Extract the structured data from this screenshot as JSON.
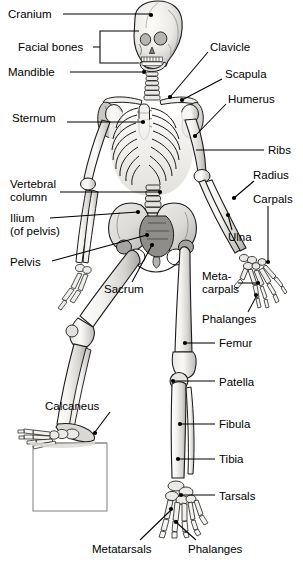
{
  "figure": {
    "view": "anterior standing figure with left foot raised on a box",
    "background_color": "#ffffff",
    "line_color": "#000000",
    "bone_fill_light": "#f2f1ee",
    "bone_fill_mid": "#d8d7d3",
    "bone_fill_dark": "#9e9c98",
    "bone_shadow": "#6f6d69",
    "box_fill": "#ffffff",
    "box_stroke": "#8a8a8a"
  },
  "labels": [
    {
      "id": "cranium",
      "text": "Cranium",
      "side": "left",
      "x": 8,
      "y": 8,
      "align": "left",
      "dot": {
        "x": 151,
        "y": 15
      },
      "path": "M 63 14 L 151 14"
    },
    {
      "id": "facial-bones",
      "text": "Facial bones",
      "side": "left",
      "x": 18,
      "y": 41,
      "align": "left",
      "dot": null,
      "path": "M 93 47 L 100 47 L 100 31 L 139 31 M 100 47 L 100 63 L 139 63"
    },
    {
      "id": "mandible",
      "text": "Mandible",
      "side": "left",
      "x": 8,
      "y": 66,
      "align": "left",
      "dot": {
        "x": 144,
        "y": 72
      },
      "path": "M 70 72 L 144 72"
    },
    {
      "id": "clavicle",
      "text": "Clavicle",
      "side": "right",
      "x": 210,
      "y": 41,
      "align": "left",
      "dot": {
        "x": 170,
        "y": 97
      },
      "path": "M 208 52 L 170 97"
    },
    {
      "id": "scapula",
      "text": "Scapula",
      "side": "right",
      "x": 225,
      "y": 68,
      "align": "left",
      "dot": {
        "x": 182,
        "y": 100
      },
      "path": "M 222 79 L 182 100"
    },
    {
      "id": "humerus",
      "text": "Humerus",
      "side": "right",
      "x": 228,
      "y": 93,
      "align": "left",
      "dot": {
        "x": 195,
        "y": 136
      },
      "path": "M 226 104 L 195 136"
    },
    {
      "id": "sternum",
      "text": "Sternum",
      "side": "left",
      "x": 12,
      "y": 112,
      "align": "left",
      "dot": {
        "x": 143,
        "y": 122
      },
      "path": "M 67 122 L 143 122"
    },
    {
      "id": "ribs",
      "text": "Ribs",
      "side": "right",
      "x": 268,
      "y": 144,
      "align": "left",
      "dot": null,
      "path": "M 264 150 L 196 150"
    },
    {
      "id": "radius",
      "text": "Radius",
      "side": "right",
      "x": 253,
      "y": 169,
      "align": "left",
      "dot": {
        "x": 234,
        "y": 198
      },
      "path": "M 254 181 L 234 198"
    },
    {
      "id": "carpals",
      "text": "Carpals",
      "side": "right",
      "x": 253,
      "y": 193,
      "align": "left",
      "dot": {
        "x": 268,
        "y": 262
      },
      "path": "M 268 206 L 268 262"
    },
    {
      "id": "vertebral-column",
      "text": "Vertebral\ncolumn",
      "side": "left",
      "x": 10,
      "y": 178,
      "align": "left",
      "dot": {
        "x": 160,
        "y": 192
      },
      "path": "M 60 192 L 160 192"
    },
    {
      "id": "ilium",
      "text": "Ilium\n(of pelvis)",
      "side": "left",
      "x": 10,
      "y": 212,
      "align": "left",
      "dot": {
        "x": 138,
        "y": 212
      },
      "path": "M 50 218 L 138 212"
    },
    {
      "id": "ulna",
      "text": "Ulna",
      "side": "right",
      "x": 228,
      "y": 231,
      "align": "left",
      "dot": {
        "x": 228,
        "y": 215
      },
      "path": "M 232 230 L 228 215"
    },
    {
      "id": "pelvis",
      "text": "Pelvis",
      "side": "left",
      "x": 10,
      "y": 256,
      "align": "left",
      "dot": {
        "x": 147,
        "y": 235
      },
      "path": "M 52 261 L 147 235"
    },
    {
      "id": "metacarpals",
      "text": "Meta-\ncarpals",
      "side": "right",
      "x": 202,
      "y": 270,
      "align": "left",
      "dot": {
        "x": 258,
        "y": 283
      },
      "path": "M 238 283 L 258 283"
    },
    {
      "id": "sacrum",
      "text": "Sacrum",
      "side": "left",
      "x": 104,
      "y": 283,
      "align": "left",
      "dot": {
        "x": 152,
        "y": 245
      },
      "path": "M 132 282 L 152 245"
    },
    {
      "id": "phalanges-hand",
      "text": "Phalanges",
      "side": "right",
      "x": 202,
      "y": 313,
      "align": "left",
      "dot": {
        "x": 256,
        "y": 295
      },
      "path": "M 248 312 L 256 297"
    },
    {
      "id": "femur",
      "text": "Femur",
      "side": "right",
      "x": 219,
      "y": 337,
      "align": "left",
      "dot": {
        "x": 185,
        "y": 343
      },
      "path": "M 215 343 L 185 343"
    },
    {
      "id": "patella",
      "text": "Patella",
      "side": "right",
      "x": 219,
      "y": 376,
      "align": "left",
      "dot": {
        "x": 173,
        "y": 381
      },
      "path": "M 215 381 L 173 381"
    },
    {
      "id": "calcaneus",
      "text": "Calcaneus",
      "side": "left",
      "x": 45,
      "y": 400,
      "align": "left",
      "dot": {
        "x": 95,
        "y": 433
      },
      "path": "M 110 412 L 95 432"
    },
    {
      "id": "fibula",
      "text": "Fibula",
      "side": "right",
      "x": 219,
      "y": 418,
      "align": "left",
      "dot": {
        "x": 180,
        "y": 424
      },
      "path": "M 215 424 L 180 424"
    },
    {
      "id": "tibia",
      "text": "Tibia",
      "side": "right",
      "x": 219,
      "y": 453,
      "align": "left",
      "dot": {
        "x": 178,
        "y": 459
      },
      "path": "M 215 459 L 178 459"
    },
    {
      "id": "tarsals",
      "text": "Tarsals",
      "side": "right",
      "x": 219,
      "y": 490,
      "align": "left",
      "dot": {
        "x": 181,
        "y": 495
      },
      "path": "M 215 495 L 181 495"
    },
    {
      "id": "metatarsals",
      "text": "Metatarsals",
      "side": "left",
      "x": 92,
      "y": 543,
      "align": "left",
      "dot": {
        "x": 171,
        "y": 509
      },
      "path": "M 140 540 L 171 510"
    },
    {
      "id": "phalanges-foot",
      "text": "Phalanges",
      "side": "right",
      "x": 188,
      "y": 543,
      "align": "left",
      "dot": {
        "x": 176,
        "y": 522
      },
      "path": "M 196 540 L 177 523"
    }
  ],
  "bone_groups": [
    {
      "name": "skull",
      "label_ref": "cranium"
    },
    {
      "name": "facial-bones",
      "label_ref": "facial-bones"
    },
    {
      "name": "mandible",
      "label_ref": "mandible"
    },
    {
      "name": "cervical-spine",
      "label_ref": "vertebral-column"
    },
    {
      "name": "clavicle",
      "label_ref": "clavicle"
    },
    {
      "name": "scapula",
      "label_ref": "scapula"
    },
    {
      "name": "sternum",
      "label_ref": "sternum"
    },
    {
      "name": "rib-cage",
      "label_ref": "ribs"
    },
    {
      "name": "humerus",
      "label_ref": "humerus"
    },
    {
      "name": "radius",
      "label_ref": "radius"
    },
    {
      "name": "ulna",
      "label_ref": "ulna"
    },
    {
      "name": "carpals",
      "label_ref": "carpals"
    },
    {
      "name": "metacarpals",
      "label_ref": "metacarpals"
    },
    {
      "name": "hand-phalanges",
      "label_ref": "phalanges-hand"
    },
    {
      "name": "pelvis",
      "label_ref": "pelvis"
    },
    {
      "name": "ilium",
      "label_ref": "ilium"
    },
    {
      "name": "sacrum",
      "label_ref": "sacrum"
    },
    {
      "name": "femur",
      "label_ref": "femur"
    },
    {
      "name": "patella",
      "label_ref": "patella"
    },
    {
      "name": "tibia",
      "label_ref": "tibia"
    },
    {
      "name": "fibula",
      "label_ref": "fibula"
    },
    {
      "name": "tarsals",
      "label_ref": "tarsals"
    },
    {
      "name": "calcaneus",
      "label_ref": "calcaneus"
    },
    {
      "name": "metatarsals",
      "label_ref": "metatarsals"
    },
    {
      "name": "foot-phalanges",
      "label_ref": "phalanges-foot"
    }
  ],
  "props": {
    "box": {
      "name": "step-box",
      "x": 33,
      "y": 443,
      "width": 74,
      "height": 68
    }
  }
}
